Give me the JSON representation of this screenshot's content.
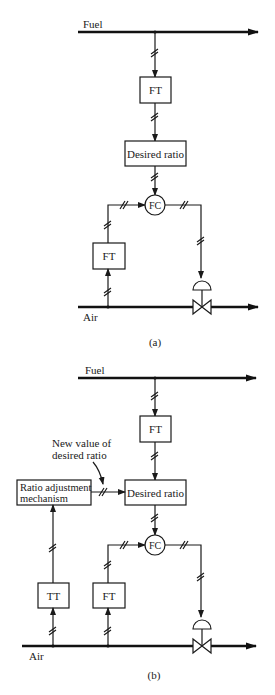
{
  "diagram": {
    "type": "process control block diagram (ratio control)",
    "panels": [
      {
        "id": "a",
        "caption": "(a)",
        "streams": {
          "fuel_label": "Fuel",
          "air_label": "Air"
        },
        "blocks": {
          "fuel_transmitter": "FT",
          "desired_ratio": "Desired ratio",
          "flow_controller": "FC",
          "air_transmitter": "FT"
        }
      },
      {
        "id": "b",
        "caption": "(b)",
        "streams": {
          "fuel_label": "Fuel",
          "air_label": "Air"
        },
        "blocks": {
          "fuel_transmitter": "FT",
          "desired_ratio": "Desired ratio",
          "flow_controller": "FC",
          "air_transmitter": "FT",
          "temperature_transmitter": "TT",
          "ratio_adjustment_line1": "Ratio adjustment",
          "ratio_adjustment_line2": "mechanism"
        },
        "annotation_line1": "New value of",
        "annotation_line2": "desired ratio"
      }
    ],
    "colors": {
      "ink": "#1a1a1a",
      "background": "#ffffff"
    }
  }
}
